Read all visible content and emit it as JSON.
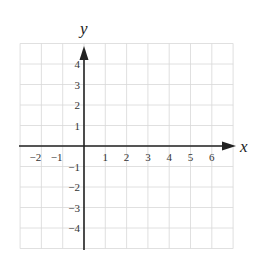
{
  "chart_data": {
    "type": "scatter",
    "title": "",
    "xlabel": "x",
    "ylabel": "y",
    "xlim": [
      -3,
      7
    ],
    "ylim": [
      -5,
      5
    ],
    "grid": true,
    "x_tick_labels": [
      "-2",
      "-1",
      "1",
      "2",
      "3",
      "4",
      "5",
      "6"
    ],
    "x_ticks": [
      -2,
      -1,
      1,
      2,
      3,
      4,
      5,
      6
    ],
    "y_tick_labels": [
      "4",
      "3",
      "2",
      "1",
      "-1",
      "-2",
      "-3",
      "-4"
    ],
    "y_ticks": [
      4,
      3,
      2,
      1,
      -1,
      -2,
      -3,
      -4
    ],
    "series": [],
    "colors": {
      "axis": "#222222",
      "grid": "#d8d8d8",
      "text": "#333333"
    }
  }
}
